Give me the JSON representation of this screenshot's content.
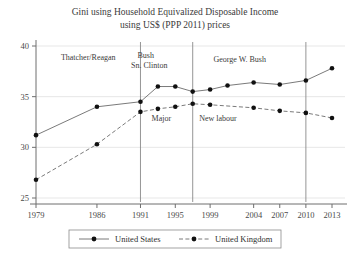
{
  "chart_data": {
    "type": "line",
    "title": "Gini using Household Equivalized Disposable Income using US$ (PPP 2011) prices",
    "title_line1": "Gini using Household Equivalized Disposable Income",
    "title_line2": "using US$ (PPP 2011) prices",
    "xlabel": "",
    "ylabel": "",
    "ylim": [
      25,
      40
    ],
    "xlim": [
      1979,
      2014
    ],
    "grid": true,
    "legend_position": "bottom",
    "yticks": [
      25,
      30,
      35,
      40
    ],
    "ytick_labels": [
      "25",
      "30",
      "35",
      "40"
    ],
    "xticks": [
      1979,
      1986,
      1991,
      1995,
      1999,
      2004,
      2007,
      2010,
      2013
    ],
    "xtick_labels": [
      "1979",
      "1986",
      "1991",
      "1995",
      "1999",
      "2004",
      "2007",
      "2010",
      "2013"
    ],
    "series": [
      {
        "name": "United States",
        "style": "solid",
        "marker": "filled-circle",
        "color": "#6b6b6b",
        "x": [
          1979,
          1986,
          1991,
          1993,
          1995,
          1997,
          1999,
          2001,
          2004,
          2007,
          2010,
          2013
        ],
        "values": [
          31.2,
          34.0,
          34.5,
          36.0,
          36.0,
          35.5,
          35.7,
          36.1,
          36.4,
          36.2,
          36.6,
          37.8
        ]
      },
      {
        "name": "United Kingdom",
        "style": "dashed",
        "marker": "filled-circle",
        "color": "#6b6b6b",
        "x": [
          1979,
          1986,
          1991,
          1993,
          1995,
          1997,
          1999,
          2004,
          2007,
          2010,
          2013
        ],
        "values": [
          26.8,
          30.3,
          33.5,
          33.8,
          34.0,
          34.3,
          34.2,
          33.9,
          33.6,
          33.4,
          32.9
        ]
      }
    ],
    "annotations": [
      {
        "text": "Thatcher/Reagan",
        "x": 1985.0,
        "y": 38.6
      },
      {
        "text": "Bush",
        "x": 1991.6,
        "y": 38.8
      },
      {
        "text": "Sn. Clinton",
        "x": 1992.0,
        "y": 37.8
      },
      {
        "text": "George W. Bush",
        "x": 2002.4,
        "y": 38.4
      },
      {
        "text": "Major",
        "x": 1993.4,
        "y": 32.6
      },
      {
        "text": "New labour",
        "x": 1999.9,
        "y": 32.6
      }
    ],
    "vertical_dividers": [
      {
        "label": "1991",
        "x": 1991.0
      },
      {
        "label": "1997",
        "x": 1997.0
      },
      {
        "label": "2010",
        "x": 2010.0
      }
    ],
    "legend_entries": [
      "United States",
      "United Kingdom"
    ]
  },
  "colors": {
    "line": "#6b6b6b",
    "marker": "#111111",
    "grid": "#dcdcdc",
    "axis": "#6e6e6e",
    "divider": "#8a8a8a",
    "text": "#2b2b2b",
    "background": "#ffffff"
  }
}
